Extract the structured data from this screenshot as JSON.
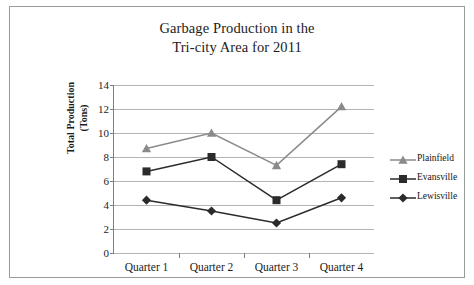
{
  "chart_data": {
    "type": "line",
    "title": "Garbage Production in the Tri-city Area for 2011",
    "title_lines": [
      "Garbage Production in the",
      "Tri-city Area for 2011"
    ],
    "xlabel": "",
    "ylabel": "Total Production (Tons)",
    "ylabel_lines": [
      "Total Production",
      "(Tons)"
    ],
    "categories": [
      "Quarter 1",
      "Quarter 2",
      "Quarter 3",
      "Quarter 4"
    ],
    "ylim": [
      0,
      14
    ],
    "ytick_labels": [
      "14",
      "12",
      "10",
      "8",
      "6",
      "4",
      "2",
      "0"
    ],
    "ytick_values": [
      14,
      12,
      10,
      8,
      6,
      4,
      2,
      0
    ],
    "grid": true,
    "legend_position": "right",
    "series": [
      {
        "name": "Plainfield",
        "marker": "triangle",
        "color": "#8a8a8a",
        "values": [
          8.7,
          10.0,
          7.3,
          12.2
        ]
      },
      {
        "name": "Evansville",
        "marker": "square",
        "color": "#2b2b2b",
        "values": [
          6.8,
          8.0,
          4.4,
          7.4
        ]
      },
      {
        "name": "Lewisville",
        "marker": "diamond",
        "color": "#2b2b2b",
        "values": [
          4.4,
          3.5,
          2.5,
          4.6
        ]
      }
    ]
  },
  "legend": {
    "items": [
      {
        "label": "Plainfield",
        "marker": "triangle-icon"
      },
      {
        "label": "Evansville",
        "marker": "square-icon"
      },
      {
        "label": "Lewisville",
        "marker": "diamond-icon"
      }
    ]
  }
}
